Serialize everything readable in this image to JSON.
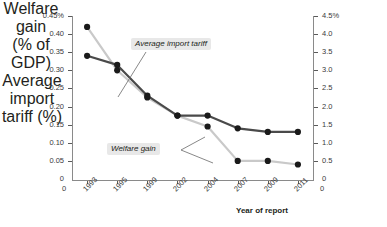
{
  "chart_data": {
    "type": "line",
    "title": "",
    "xlabel": "Year of report",
    "categories": [
      "1993",
      "1995",
      "1999",
      "2002",
      "2004",
      "2007",
      "2009",
      "2011"
    ],
    "axis_end_labels": {
      "left": "0",
      "right": "0"
    },
    "grid": false,
    "legend_position": "inline-annotations",
    "left_axis": {
      "label_line1": "Welfare gain",
      "label_line2": "(% of GDP)",
      "ylim": [
        0,
        0.45
      ],
      "ticks": [
        "0",
        "0.05",
        "0.10",
        "0.15",
        "0.20",
        "0.25",
        "0.30",
        "0.35",
        "0.40",
        "0.45%"
      ],
      "tick_values": [
        0,
        0.05,
        0.1,
        0.15,
        0.2,
        0.25,
        0.3,
        0.35,
        0.4,
        0.45
      ]
    },
    "right_axis": {
      "label_line1": "Average import",
      "label_line2": "tariff (%)",
      "ylim": [
        0,
        4.5
      ],
      "ticks": [
        "0",
        "0.5",
        "1.0",
        "1.5",
        "2.0",
        "2.5",
        "3.0",
        "3.5",
        "4.0",
        "4.5%"
      ],
      "tick_values": [
        0,
        0.5,
        1.0,
        1.5,
        2.0,
        2.5,
        3.0,
        3.5,
        4.0,
        4.5
      ]
    },
    "series": [
      {
        "name": "Welfare gain",
        "axis": "left",
        "color": "#c9c9c9",
        "marker_color": "#1a1a1a",
        "values": [
          0.42,
          0.3,
          0.225,
          0.175,
          0.145,
          0.05,
          0.05,
          0.04
        ]
      },
      {
        "name": "Average import tariff",
        "axis": "right",
        "color": "#4a4a4a",
        "marker_color": "#1a1a1a",
        "values": [
          3.4,
          3.15,
          2.3,
          1.75,
          1.75,
          1.4,
          1.3,
          1.3
        ]
      }
    ],
    "annotations": [
      {
        "text": "Average import tariff",
        "target_series": "Average import tariff"
      },
      {
        "text": "Welfare gain",
        "target_series": "Welfare gain"
      }
    ]
  },
  "footnote": {
    "text": ""
  }
}
